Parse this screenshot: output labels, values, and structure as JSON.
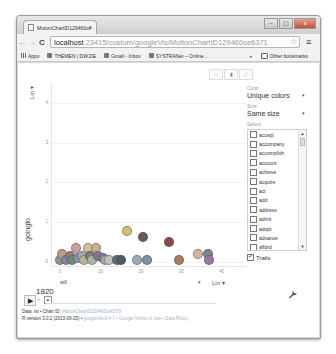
{
  "browser": {
    "tab_title": "MotionChartID129460ce:",
    "tab_close": "×",
    "url_host": "localhost",
    "url_rest": ":23415/custom/googleVis/MotionChartID129460ce6371",
    "nav": {
      "back": "←",
      "forward": "→",
      "reload": "C"
    },
    "star": "☆",
    "menu": "≡",
    "window_controls": [
      "–",
      "▢",
      "x"
    ],
    "bookmarks": [
      {
        "label": "Apps"
      },
      {
        "label": "THEMEN | DW.DE"
      },
      {
        "label": "Gmail - Inbox"
      },
      {
        "label": "SYSTRANet – Online..."
      }
    ],
    "bookmarks_overflow": "»",
    "other_bookmarks": "Other bookmarks"
  },
  "chart": {
    "view_buttons": [
      "bubble-view",
      "bar-view",
      "line-view"
    ],
    "view_icons": [
      "⁘",
      "▮",
      "⁄"
    ],
    "y_axis_label": "goingto",
    "y_scale": "Lin ▾",
    "x_axis_label": "will",
    "x_scale": "Lin ▾",
    "x_scale_arrow": "▾",
    "year": "1820",
    "play_icon": "▶",
    "speed_icon": "♫",
    "step_icon": "■",
    "wrench_icon": "🔧"
  },
  "panel": {
    "color_label": "Color",
    "color_value": "Unique colors",
    "size_label": "Size",
    "size_value": "Same size",
    "select_label": "Select",
    "dropdown_arrow": "▾",
    "items": [
      "accept",
      "accompany",
      "accomplish",
      "account",
      "achieve",
      "acquire",
      "act",
      "add",
      "address",
      "admit",
      "adopt",
      "advance",
      "afford",
      "agree",
      "aid"
    ],
    "trails_label": "Trails",
    "scroll_up": "▲",
    "scroll_down": "▼"
  },
  "footer": {
    "line1_prefix": "Data: tst • Chart ID: ",
    "line1_id": "MotionChartID129460ce6378",
    "line2_prefix": "R version 3.0.2 (2013-09-25) • ",
    "line2_links": "googleVis-0.4.7 • Google Terms of Use • Data Policy"
  },
  "chart_data": {
    "type": "scatter",
    "title": "",
    "xlabel": "will",
    "ylabel": "goingto",
    "xlim": [
      -2,
      46
    ],
    "ylim": [
      -0.1,
      4.5
    ],
    "x_ticks": [
      "0",
      "10",
      "20",
      "30",
      "40"
    ],
    "y_ticks": [
      "0",
      "1",
      "2",
      "3",
      "4"
    ],
    "grid": true,
    "legend": "none",
    "time": "1820",
    "points": [
      {
        "x": 0,
        "y": 0,
        "color": "#8a9a8a"
      },
      {
        "x": 0.5,
        "y": 0.15,
        "color": "#b8a27a"
      },
      {
        "x": 1.5,
        "y": 0,
        "color": "#7a8aa6"
      },
      {
        "x": 2.5,
        "y": 0.1,
        "color": "#9f7a7a"
      },
      {
        "x": 3,
        "y": 0,
        "color": "#6f8f6f"
      },
      {
        "x": 4,
        "y": 0.3,
        "color": "#c9a0a0"
      },
      {
        "x": 4.5,
        "y": 0.05,
        "color": "#8c8cb8"
      },
      {
        "x": 5.5,
        "y": 0.1,
        "color": "#a8a8a8"
      },
      {
        "x": 6,
        "y": 0,
        "color": "#b9b39a"
      },
      {
        "x": 7,
        "y": 0.3,
        "color": "#cfc0a0"
      },
      {
        "x": 7.5,
        "y": 0.1,
        "color": "#7a7a7a"
      },
      {
        "x": 8,
        "y": 0,
        "color": "#a3b8a3"
      },
      {
        "x": 9,
        "y": 0.3,
        "color": "#c8b090"
      },
      {
        "x": 9.5,
        "y": 0.1,
        "color": "#8f6f8f"
      },
      {
        "x": 10.5,
        "y": 0.05,
        "color": "#6f7f9f"
      },
      {
        "x": 11,
        "y": 0,
        "color": "#b0a0a0"
      },
      {
        "x": 12,
        "y": 0,
        "color": "#c0c0c0"
      },
      {
        "x": 14,
        "y": 0,
        "color": "#607070"
      },
      {
        "x": 15,
        "y": 0,
        "color": "#505a60"
      },
      {
        "x": 16.5,
        "y": 0.72,
        "color": "#d2c070"
      },
      {
        "x": 19,
        "y": 0,
        "color": "#a0a8b8"
      },
      {
        "x": 20.5,
        "y": 0.57,
        "color": "#6a5a5a"
      },
      {
        "x": 21.5,
        "y": 0,
        "color": "#7f8f9f"
      },
      {
        "x": 27,
        "y": 0.45,
        "color": "#8a4a4a"
      },
      {
        "x": 29.5,
        "y": 0,
        "color": "#b07a60"
      },
      {
        "x": 34,
        "y": 0.15,
        "color": "#d0b8a0"
      },
      {
        "x": 36.5,
        "y": 0.15,
        "color": "#708890"
      },
      {
        "x": 36.8,
        "y": 0,
        "color": "#9a7a9a"
      }
    ]
  }
}
